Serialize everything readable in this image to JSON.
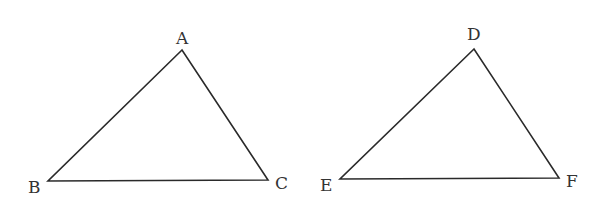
{
  "diagram": {
    "triangles": [
      {
        "name": "ABC",
        "vertices": [
          {
            "label": "A",
            "x": 182,
            "y": 50
          },
          {
            "label": "B",
            "x": 48,
            "y": 181
          },
          {
            "label": "C",
            "x": 268,
            "y": 180
          }
        ]
      },
      {
        "name": "DEF",
        "vertices": [
          {
            "label": "D",
            "x": 474,
            "y": 49
          },
          {
            "label": "E",
            "x": 340,
            "y": 179
          },
          {
            "label": "F",
            "x": 559,
            "y": 178
          }
        ]
      }
    ],
    "colors": {
      "stroke": "#2a2a2a",
      "label": "#333333",
      "background": "#ffffff"
    }
  }
}
